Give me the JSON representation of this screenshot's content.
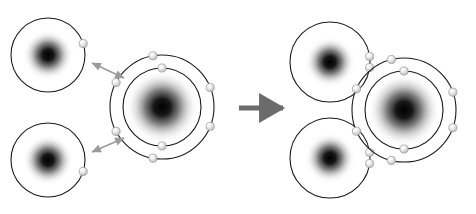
{
  "diagram": {
    "background_color": "#ffffff",
    "shell_stroke_color": "#1a1a1a",
    "shell_stroke_width": 1.1,
    "nucleus_core_color": "#000000",
    "nucleus_mid_color": "#6e6e6e",
    "electron_fill_color": "#e2e2e2",
    "electron_stroke_color": "#9a9a9a",
    "electron_highlight_color": "#fbfbfb",
    "bond_arrow_color": "#9b9b9b",
    "reaction_arrow_color": "#6b6b6b"
  },
  "chart_data": {
    "type": "diagram",
    "xlabel": "",
    "ylabel": "",
    "panels": [
      {
        "name": "before-bonding",
        "label": "Separate hydrogen and oxygen atoms",
        "atoms": [
          {
            "name": "hydrogen-top-left",
            "element": "H",
            "cx": 48,
            "cy": 55,
            "nucleus_radius": 13,
            "shells": [
              {
                "radius": 37,
                "electron_count": 1,
                "electron_angles": [
                  18
                ]
              }
            ]
          },
          {
            "name": "hydrogen-bottom-left",
            "element": "H",
            "cx": 48,
            "cy": 160,
            "nucleus_radius": 13,
            "shells": [
              {
                "radius": 37,
                "electron_count": 1,
                "electron_angles": [
                  -18
                ]
              }
            ]
          },
          {
            "name": "oxygen-left",
            "element": "O",
            "cx": 162,
            "cy": 107,
            "nucleus_radius": 19,
            "shells": [
              {
                "radius": 39,
                "electron_count": 2,
                "electron_angles": [
                  90,
                  -90
                ]
              },
              {
                "radius": 52,
                "electron_count": 6,
                "electron_angles": [
                  100,
                  152,
                  -152,
                  -100,
                  -22,
                  22
                ]
              }
            ]
          }
        ],
        "bond_arrows": [
          {
            "name": "bond-arrow-top",
            "x1": 92,
            "y1": 63,
            "x2": 124,
            "y2": 78,
            "double_headed": true
          },
          {
            "name": "bond-arrow-bottom",
            "x1": 92,
            "y1": 152,
            "x2": 124,
            "y2": 138,
            "double_headed": true
          }
        ]
      },
      {
        "name": "after-bonding",
        "label": "Water molecule with two covalent bonds",
        "atoms": [
          {
            "name": "hydrogen-top-right",
            "element": "H",
            "cx": 330,
            "cy": 62,
            "nucleus_radius": 13,
            "shells": [
              {
                "radius": 40,
                "electron_count": 2,
                "electron_angles": [
                  8,
                  -8
                ]
              }
            ]
          },
          {
            "name": "hydrogen-bottom-right",
            "element": "H",
            "cx": 330,
            "cy": 158,
            "nucleus_radius": 13,
            "shells": [
              {
                "radius": 40,
                "electron_count": 2,
                "electron_angles": [
                  -8,
                  8
                ]
              }
            ]
          },
          {
            "name": "oxygen-right",
            "element": "O",
            "cx": 404,
            "cy": 110,
            "nucleus_radius": 19,
            "shells": [
              {
                "radius": 39,
                "electron_count": 2,
                "electron_angles": [
                  90,
                  -90
                ]
              },
              {
                "radius": 52,
                "electron_count": 6,
                "electron_angles": [
                  104,
                  156,
                  -156,
                  -104,
                  -20,
                  20
                ]
              }
            ]
          }
        ],
        "bond_arrows": []
      }
    ],
    "reaction_arrow": {
      "name": "reaction-arrow",
      "x1": 239,
      "y1": 108,
      "x2": 283,
      "y2": 108,
      "direction": "right"
    },
    "legend": []
  }
}
